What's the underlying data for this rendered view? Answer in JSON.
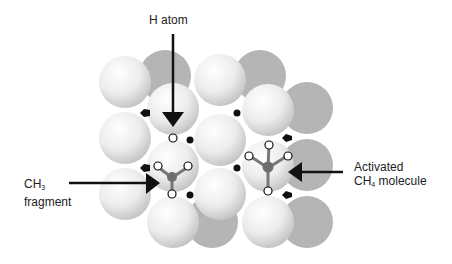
{
  "labels": {
    "h_atom": "H atom",
    "ch3_main": "CH",
    "ch3_sub": "3",
    "ch3_line2": "fragment",
    "ch4_line1": "Activated",
    "ch4_main": "CH",
    "ch4_sub": "4",
    "ch4_rest": " molecule"
  },
  "colors": {
    "front_sphere": "#f0f0f0",
    "back_sphere": "#b8b8b8",
    "arrow": "#111111",
    "carbon": "#6e6e6e",
    "hydrogen_fill": "#ffffff",
    "site_marker": "#111111"
  }
}
